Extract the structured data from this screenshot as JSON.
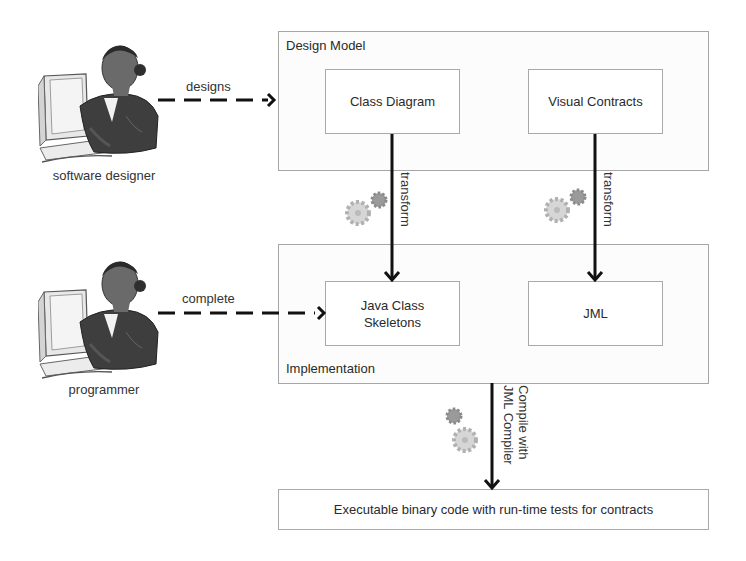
{
  "actors": [
    {
      "id": "software-designer",
      "label": "software designer"
    },
    {
      "id": "programmer",
      "label": "programmer"
    }
  ],
  "containers": {
    "design_model": {
      "title": "Design Model",
      "boxes": [
        {
          "label": "Class Diagram"
        },
        {
          "label": "Visual Contracts"
        }
      ]
    },
    "implementation": {
      "title": "Implementation",
      "boxes": [
        {
          "label_line1": "Java Class",
          "label_line2": "Skeletons"
        },
        {
          "label": "JML"
        }
      ]
    }
  },
  "result": {
    "label": "Executable binary code with run-time tests for contracts"
  },
  "edges": {
    "designs": "designs",
    "complete": "complete",
    "transform_left": "transform",
    "transform_right": "transform",
    "compile_line1": "Compile with",
    "compile_line2": "JML Compiler"
  },
  "icons": {
    "actor": "person-at-computer-icon",
    "process": "gears-icon"
  },
  "colors": {
    "line": "#111111",
    "box_border": "#a9a9a9",
    "text": "#2a2a2a",
    "gear_light": "#c8c8c8",
    "gear_dark": "#8a8a8a"
  }
}
